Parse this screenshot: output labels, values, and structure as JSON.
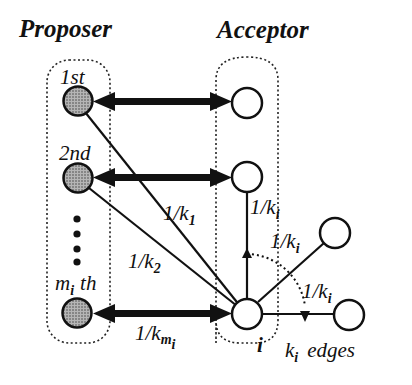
{
  "titles": {
    "proposer": "Proposer",
    "acceptor": "Acceptor"
  },
  "proposer_nodes": [
    {
      "label": "1st",
      "label_main": "1st",
      "label_sub": ""
    },
    {
      "label": "2nd",
      "label_main": "2nd",
      "label_sub": ""
    },
    {
      "label": "m_i th",
      "label_main": "m",
      "label_sub": "i",
      "label_suffix": "th"
    }
  ],
  "edge_labels": {
    "k1": {
      "prefix": "1/k",
      "sub": "1"
    },
    "k2": {
      "prefix": "1/k",
      "sub": "2"
    },
    "kmi": {
      "prefix": "1/k",
      "sub": "m",
      "subsub": "i"
    },
    "ki_up": {
      "prefix": "1/k",
      "sub": "i"
    },
    "ki_diag": {
      "prefix": "1/k",
      "sub": "i"
    },
    "ki_right": {
      "prefix": "1/k",
      "sub": "i"
    }
  },
  "node_i_label": "i",
  "edges_caption": {
    "k": "k",
    "sub": "i",
    "text": "edges"
  },
  "colors": {
    "proposer_fill": "#8a8a8a",
    "stroke": "#111111",
    "acceptor_fill": "#ffffff"
  }
}
